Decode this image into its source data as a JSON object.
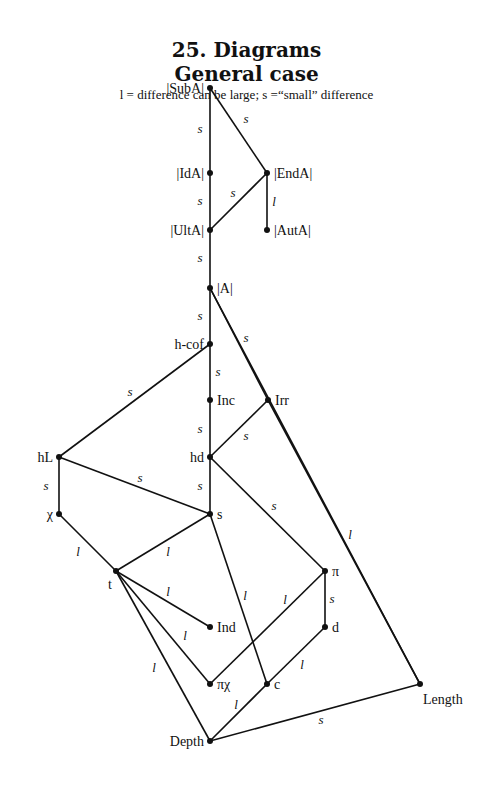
{
  "header": {
    "title": "25. Diagrams",
    "subtitle": "General case",
    "legend": "l = difference can be large; s =“small” difference"
  },
  "nodes": [
    {
      "id": "SubA",
      "label": "|SubA|",
      "x": 210,
      "y": 88,
      "label_pos": "left"
    },
    {
      "id": "IdA",
      "label": "|IdA|",
      "x": 210,
      "y": 173,
      "label_pos": "left"
    },
    {
      "id": "EndA",
      "label": "|EndA|",
      "x": 267,
      "y": 173,
      "label_pos": "right"
    },
    {
      "id": "UltA",
      "label": "|UltA|",
      "x": 210,
      "y": 230,
      "label_pos": "left"
    },
    {
      "id": "AutA",
      "label": "|AutA|",
      "x": 267,
      "y": 230,
      "label_pos": "right"
    },
    {
      "id": "A",
      "label": "|A|",
      "x": 210,
      "y": 288,
      "label_pos": "right"
    },
    {
      "id": "hcof",
      "label": "h-cof",
      "x": 210,
      "y": 344,
      "label_pos": "left"
    },
    {
      "id": "Inc",
      "label": "Inc",
      "x": 210,
      "y": 400,
      "label_pos": "right"
    },
    {
      "id": "Irr",
      "label": "Irr",
      "x": 268,
      "y": 400,
      "label_pos": "right"
    },
    {
      "id": "hd",
      "label": "hd",
      "x": 210,
      "y": 457,
      "label_pos": "left"
    },
    {
      "id": "hL",
      "label": "hL",
      "x": 59,
      "y": 457,
      "label_pos": "left"
    },
    {
      "id": "chi",
      "label": "χ",
      "x": 59,
      "y": 514,
      "label_pos": "left"
    },
    {
      "id": "s",
      "label": "s",
      "x": 210,
      "y": 514,
      "label_pos": "right"
    },
    {
      "id": "t",
      "label": "t",
      "x": 116,
      "y": 571,
      "label_pos": "below-left"
    },
    {
      "id": "pi",
      "label": "π",
      "x": 325,
      "y": 571,
      "label_pos": "right"
    },
    {
      "id": "Ind",
      "label": "Ind",
      "x": 210,
      "y": 627,
      "label_pos": "right"
    },
    {
      "id": "d",
      "label": "d",
      "x": 325,
      "y": 627,
      "label_pos": "right"
    },
    {
      "id": "pichi",
      "label": "πχ",
      "x": 210,
      "y": 684,
      "label_pos": "right"
    },
    {
      "id": "c",
      "label": "c",
      "x": 267,
      "y": 684,
      "label_pos": "right"
    },
    {
      "id": "Length",
      "label": "Length",
      "x": 420,
      "y": 684,
      "label_pos": "below-right"
    },
    {
      "id": "Depth",
      "label": "Depth",
      "x": 210,
      "y": 741,
      "label_pos": "left"
    }
  ],
  "edges": [
    {
      "from": "SubA",
      "to": "IdA",
      "label": "s",
      "lx": 200,
      "ly": 133
    },
    {
      "from": "SubA",
      "to": "EndA",
      "label": "s",
      "lx": 246,
      "ly": 123
    },
    {
      "from": "IdA",
      "to": "UltA",
      "label": "s",
      "lx": 200,
      "ly": 205
    },
    {
      "from": "EndA",
      "to": "UltA",
      "label": "s",
      "lx": 233,
      "ly": 197
    },
    {
      "from": "EndA",
      "to": "AutA",
      "label": "l",
      "lx": 274,
      "ly": 206
    },
    {
      "from": "UltA",
      "to": "A",
      "label": "s",
      "lx": 200,
      "ly": 262
    },
    {
      "from": "A",
      "to": "hcof",
      "label": "s",
      "lx": 200,
      "ly": 320
    },
    {
      "from": "A",
      "to": "Length",
      "label": "s",
      "lx": 246,
      "ly": 342
    },
    {
      "from": "A",
      "to": "Irr",
      "label": "",
      "lx": 0,
      "ly": 0
    },
    {
      "from": "hcof",
      "to": "Inc",
      "label": "s",
      "lx": 218,
      "ly": 376
    },
    {
      "from": "hcof",
      "to": "hL",
      "label": "s",
      "lx": 130,
      "ly": 396
    },
    {
      "from": "Inc",
      "to": "hd",
      "label": "s",
      "lx": 200,
      "ly": 433
    },
    {
      "from": "Irr",
      "to": "hd",
      "label": "s",
      "lx": 246,
      "ly": 440
    },
    {
      "from": "Irr",
      "to": "Length",
      "label": "l",
      "lx": 350,
      "ly": 539
    },
    {
      "from": "hd",
      "to": "s",
      "label": "s",
      "lx": 200,
      "ly": 490
    },
    {
      "from": "hd",
      "to": "pi",
      "label": "s",
      "lx": 274,
      "ly": 510
    },
    {
      "from": "hL",
      "to": "chi",
      "label": "s",
      "lx": 46,
      "ly": 490
    },
    {
      "from": "hL",
      "to": "s",
      "label": "s",
      "lx": 140,
      "ly": 482
    },
    {
      "from": "chi",
      "to": "t",
      "label": "l",
      "lx": 78,
      "ly": 556
    },
    {
      "from": "s",
      "to": "t",
      "label": "l",
      "lx": 168,
      "ly": 556
    },
    {
      "from": "s",
      "to": "c",
      "label": "l",
      "lx": 245,
      "ly": 600
    },
    {
      "from": "t",
      "to": "Ind",
      "label": "l",
      "lx": 168,
      "ly": 596
    },
    {
      "from": "t",
      "to": "pichi",
      "label": "l",
      "lx": 185,
      "ly": 640
    },
    {
      "from": "t",
      "to": "Depth",
      "label": "l",
      "lx": 154,
      "ly": 672
    },
    {
      "from": "pi",
      "to": "d",
      "label": "s",
      "lx": 332,
      "ly": 603
    },
    {
      "from": "pi",
      "to": "pichi",
      "label": "l",
      "lx": 285,
      "ly": 604
    },
    {
      "from": "d",
      "to": "c",
      "label": "l",
      "lx": 302,
      "ly": 669
    },
    {
      "from": "c",
      "to": "Depth",
      "label": "l",
      "lx": 236,
      "ly": 709
    },
    {
      "from": "Depth",
      "to": "Length",
      "label": "s",
      "lx": 321,
      "ly": 724
    }
  ]
}
